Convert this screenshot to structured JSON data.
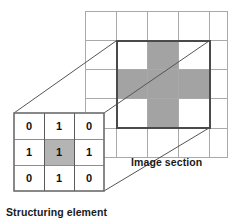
{
  "figure": {
    "background_color": "#ffffff"
  },
  "colors": {
    "grid_line": "#a9a9a9",
    "bold_outline": "#4a4a4a",
    "shaded_cell": "#a0a0a0",
    "se_shaded_cell": "#b4b4b4",
    "se_border": "#6e6e6e",
    "connector_line": "#555555",
    "text": "#111111"
  },
  "image_section": {
    "label": "Image section",
    "grid": {
      "columns": 5,
      "rows": 5,
      "cell_width": 31,
      "cell_height": 29,
      "origin_x": 85,
      "origin_y": 11
    },
    "highlight_box": {
      "label": "neighborhood-outline",
      "col_start": 1,
      "col_end": 4,
      "row_start": 1,
      "row_end": 4
    },
    "shaded_cells": [
      {
        "col": 2,
        "row": 1
      },
      {
        "col": 1,
        "row": 2
      },
      {
        "col": 2,
        "row": 2
      },
      {
        "col": 3,
        "row": 2
      },
      {
        "col": 2,
        "row": 3
      }
    ]
  },
  "structuring_element": {
    "label": "Structuring element",
    "rows": 3,
    "columns": 3,
    "values": [
      [
        "0",
        "1",
        "0"
      ],
      [
        "1",
        "1",
        "1"
      ],
      [
        "0",
        "1",
        "0"
      ]
    ],
    "shaded_cell": {
      "col": 1,
      "row": 1
    },
    "origin_x": 14,
    "origin_y": 113,
    "cell_width": 30,
    "cell_height": 26
  },
  "connectors": [
    {
      "name": "top-left-connector",
      "from": [
        14,
        113
      ],
      "to": [
        116,
        41
      ]
    },
    {
      "name": "top-right-connector",
      "from": [
        104,
        113
      ],
      "to": [
        209,
        41
      ]
    },
    {
      "name": "bottom-right-connector",
      "from": [
        104,
        191
      ],
      "to": [
        209,
        128
      ]
    }
  ]
}
